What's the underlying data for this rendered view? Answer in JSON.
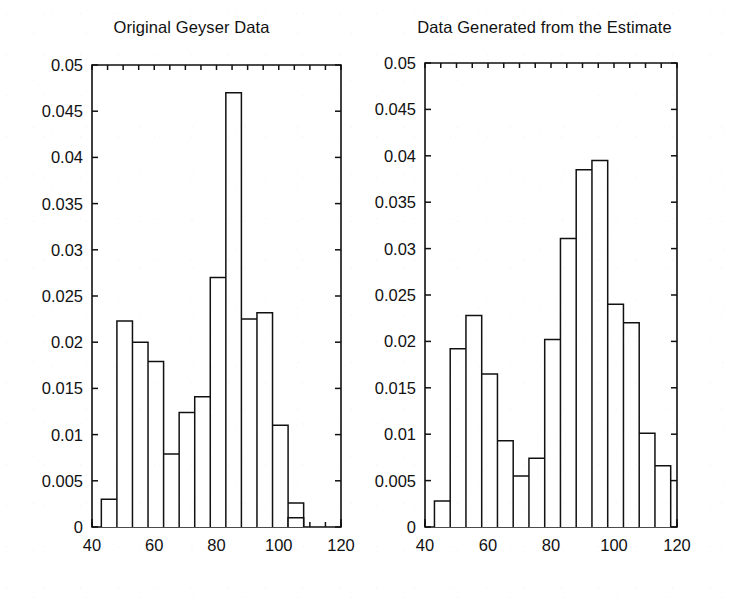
{
  "figure": {
    "background_color": "#ffffff",
    "ink_color": "#111111",
    "panel_count": 2
  },
  "panels": [
    {
      "id": "left",
      "title": "Original Geyser Data",
      "geometry": {
        "x0": 92,
        "y0": 65,
        "x1": 341,
        "y1": 527
      }
    },
    {
      "id": "right",
      "title": "Data Generated from the Estimate",
      "geometry": {
        "x0": 58,
        "y0": 63,
        "x1": 310,
        "y1": 527
      }
    }
  ],
  "axes": {
    "x_ticks": [
      40,
      60,
      80,
      100,
      120
    ],
    "x_tick_labels": [
      "40",
      "60",
      "80",
      "100",
      "120"
    ],
    "x_minor_step": 5,
    "xlim": [
      40,
      120
    ],
    "y_ticks": [
      0,
      0.005,
      0.01,
      0.015,
      0.02,
      0.025,
      0.03,
      0.035,
      0.04,
      0.045,
      0.05
    ],
    "y_tick_labels": [
      "0",
      "0.005",
      "0.01",
      "0.015",
      "0.02",
      "0.025",
      "0.03",
      "0.035",
      "0.04",
      "0.045",
      "0.05"
    ],
    "ylim": [
      0,
      0.05
    ]
  },
  "chart_data": [
    {
      "type": "bar",
      "title": "Original Geyser Data",
      "xlabel": "",
      "ylabel": "",
      "xlim": [
        40,
        120
      ],
      "ylim": [
        0,
        0.05
      ],
      "grid": false,
      "legend": false,
      "bin_width": 5,
      "bin_edges": [
        43,
        48,
        53,
        58,
        63,
        68,
        73,
        78,
        83,
        88,
        93,
        98,
        103,
        108
      ],
      "categories": [
        "43-48",
        "48-53",
        "53-58",
        "58-63",
        "63-68",
        "68-73",
        "73-78",
        "78-83",
        "83-88",
        "88-93",
        "93-98",
        "98-103",
        "103-108"
      ],
      "values": [
        0.003,
        0.0223,
        0.02,
        0.0179,
        0.0079,
        0.0124,
        0.0141,
        0.027,
        0.047,
        0.0225,
        0.0232,
        0.011,
        0.0026
      ],
      "extra_bars": [
        {
          "x_start": 103,
          "x_end": 108,
          "value": 0.001
        }
      ]
    },
    {
      "type": "bar",
      "title": "Data Generated from the Estimate",
      "xlabel": "",
      "ylabel": "",
      "xlim": [
        40,
        120
      ],
      "ylim": [
        0,
        0.05
      ],
      "grid": false,
      "legend": false,
      "bin_width": 5,
      "bin_edges": [
        43,
        48,
        53,
        58,
        63,
        68,
        73,
        78,
        83,
        88,
        93,
        98
      ],
      "categories": [
        "43-48",
        "48-53",
        "53-58",
        "58-63",
        "63-68",
        "68-73",
        "73-78",
        "78-83",
        "83-88",
        "88-93",
        "93-98"
      ],
      "values": [
        0.0028,
        0.0192,
        0.0228,
        0.0165,
        0.0093,
        0.0055,
        0.0074,
        0.0202,
        0.0311,
        0.0385,
        0.0395,
        0.024,
        0.022,
        0.0101,
        0.0066
      ]
    }
  ]
}
